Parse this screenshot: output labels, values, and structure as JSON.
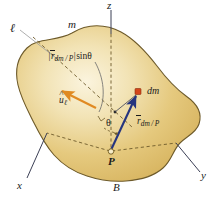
{
  "figure": {
    "background_color": "#ffffff",
    "body_fill_color": "#e2c474",
    "body_highlight_color": "#f7efd6",
    "body_outline_color": "#6d5a2a",
    "axis_color": "#3b3f55",
    "dashed_color": "#6d5a2a",
    "vector_blue_color": "#26357f",
    "vector_orange_color": "#e08a22",
    "marker_red_color": "#d4461b",
    "leader_color": "#8a8a8a"
  },
  "axes": {
    "z": {
      "label": "z"
    },
    "x": {
      "label": "x"
    },
    "y": {
      "label": "y"
    }
  },
  "labels": {
    "body": "B",
    "mass": "m",
    "axis_line": "ℓ",
    "point_p": "P",
    "mass_element": "dm",
    "angle": "θ"
  },
  "vectors": {
    "position": {
      "name": "r_dm/P",
      "symbol": "r",
      "subscript": "dm / P",
      "color": "#26357f"
    },
    "unit_axis": {
      "name": "u_l",
      "symbol": "u",
      "subscript": "ℓ",
      "color": "#e08a22"
    }
  },
  "expressions": {
    "perpendicular_distance": {
      "bar_open": "|",
      "symbol": "r",
      "subscript": "dm / P",
      "bar_close": "|",
      "trig": "sin",
      "angle": "θ"
    }
  }
}
